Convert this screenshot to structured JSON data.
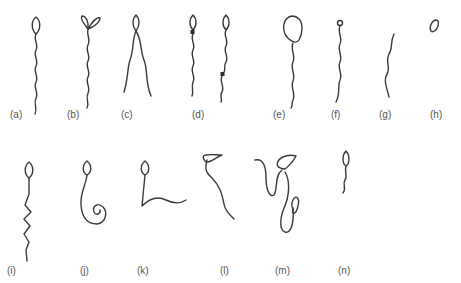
{
  "figure": {
    "colors": {
      "ink": "#3a3a3a",
      "label": "#555555",
      "background": "#ffffff"
    },
    "panels": [
      {
        "id": "a",
        "label": "(a)",
        "depicts": "normal sperm: oval head, wavy tail"
      },
      {
        "id": "b",
        "label": "(b)",
        "depicts": "double-headed sperm"
      },
      {
        "id": "c",
        "label": "(c)",
        "depicts": "double-tailed sperm"
      },
      {
        "id": "d",
        "label": "(d)",
        "depicts": "cytoplasmic droplet (proximal and distal)"
      },
      {
        "id": "e",
        "label": "(e)",
        "depicts": "macrocephalic (large head)"
      },
      {
        "id": "f",
        "label": "(f)",
        "depicts": "microcephalic (small head)"
      },
      {
        "id": "g",
        "label": "(g)",
        "depicts": "detached tail"
      },
      {
        "id": "h",
        "label": "(h)",
        "depicts": "detached head"
      },
      {
        "id": "i",
        "label": "(i)",
        "depicts": "kinked / zigzag tail"
      },
      {
        "id": "j",
        "label": "(j)",
        "depicts": "coiled tail"
      },
      {
        "id": "k",
        "label": "(k)",
        "depicts": "bent tail"
      },
      {
        "id": "l",
        "label": "(l)",
        "depicts": "bent midpiece"
      },
      {
        "id": "m",
        "label": "(m)",
        "depicts": "looped / folded tail"
      },
      {
        "id": "n",
        "label": "(n)",
        "depicts": "short tail"
      }
    ]
  }
}
